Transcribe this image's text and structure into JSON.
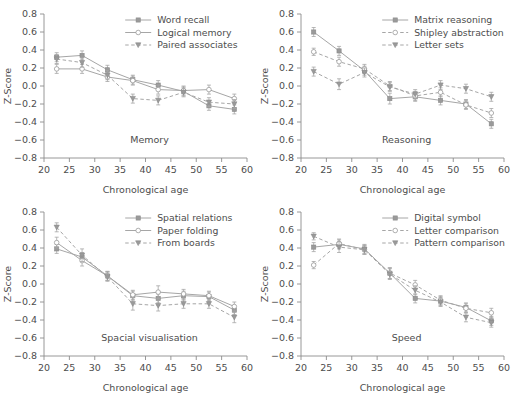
{
  "figure": {
    "x_axis_label": "Chronological age",
    "y_axis_label": "Z-Score",
    "x_ticks": [
      20,
      25,
      30,
      35,
      40,
      45,
      50,
      55,
      60
    ],
    "y_ticks": [
      -0.8,
      -0.6,
      -0.4,
      -0.2,
      0.0,
      0.2,
      0.4,
      0.6,
      0.8
    ],
    "xlim": [
      20,
      60
    ],
    "ylim": [
      -0.8,
      0.8
    ],
    "line_color": "#a6a6a6",
    "text_color": "#4d4d4d",
    "background": "#ffffff"
  },
  "chart_data": [
    {
      "type": "line",
      "title": "Memory",
      "panel_id": "memory",
      "xlabel": "Chronological age",
      "ylabel": "Z-Score",
      "xlim": [
        20,
        60
      ],
      "ylim": [
        -0.8,
        0.8
      ],
      "grid": false,
      "legend_position": "top-right",
      "x": [
        22.5,
        27.5,
        32.5,
        37.5,
        42.5,
        47.5,
        52.5,
        57.5
      ],
      "series": [
        {
          "name": "Word recall",
          "marker": "filled-square",
          "dash": "solid",
          "values": [
            0.32,
            0.34,
            0.18,
            0.07,
            0.01,
            -0.06,
            -0.22,
            -0.26
          ],
          "errors": [
            0.05,
            0.05,
            0.05,
            0.05,
            0.05,
            0.05,
            0.05,
            0.05
          ]
        },
        {
          "name": "Logical memory",
          "marker": "open-circle",
          "dash": "solid",
          "values": [
            0.19,
            0.19,
            0.1,
            0.06,
            -0.04,
            -0.05,
            -0.04,
            -0.14
          ],
          "errors": [
            0.05,
            0.05,
            0.05,
            0.05,
            0.05,
            0.05,
            0.05,
            0.05
          ]
        },
        {
          "name": "Paired associates",
          "marker": "filled-triangle",
          "dash": "dashed",
          "values": [
            0.3,
            0.26,
            0.12,
            -0.14,
            -0.16,
            -0.07,
            -0.18,
            -0.2
          ],
          "errors": [
            0.05,
            0.05,
            0.05,
            0.05,
            0.05,
            0.05,
            0.05,
            0.05
          ]
        }
      ]
    },
    {
      "type": "line",
      "title": "Reasoning",
      "panel_id": "reasoning",
      "xlabel": "Chronological age",
      "ylabel": "Z-Score",
      "xlim": [
        20,
        60
      ],
      "ylim": [
        -0.8,
        0.8
      ],
      "grid": false,
      "legend_position": "top-right",
      "x": [
        22.5,
        27.5,
        32.5,
        37.5,
        42.5,
        47.5,
        52.5,
        57.5
      ],
      "series": [
        {
          "name": "Matrix reasoning",
          "marker": "filled-square",
          "dash": "solid",
          "values": [
            0.6,
            0.39,
            0.17,
            -0.14,
            -0.12,
            -0.16,
            -0.2,
            -0.42
          ],
          "errors": [
            0.05,
            0.05,
            0.05,
            0.06,
            0.05,
            0.05,
            0.05,
            0.05
          ]
        },
        {
          "name": "Shipley abstraction",
          "marker": "open-circle",
          "dash": "dashed",
          "values": [
            0.38,
            0.27,
            0.19,
            0.0,
            -0.11,
            -0.07,
            -0.21,
            -0.3
          ],
          "errors": [
            0.04,
            0.05,
            0.05,
            0.05,
            0.05,
            0.05,
            0.05,
            0.05
          ]
        },
        {
          "name": "Letter sets",
          "marker": "filled-triangle",
          "dash": "dashed",
          "values": [
            0.16,
            0.02,
            0.15,
            -0.01,
            -0.09,
            0.01,
            -0.03,
            -0.12
          ],
          "errors": [
            0.05,
            0.06,
            0.05,
            0.05,
            0.05,
            0.05,
            0.05,
            0.05
          ]
        }
      ]
    },
    {
      "type": "line",
      "title": "Spacial visualisation",
      "panel_id": "spatial",
      "xlabel": "Chronological age",
      "ylabel": "Z-Score",
      "xlim": [
        20,
        60
      ],
      "ylim": [
        -0.8,
        0.8
      ],
      "grid": false,
      "legend_position": "top-right",
      "x": [
        22.5,
        27.5,
        32.5,
        37.5,
        42.5,
        47.5,
        52.5,
        57.5
      ],
      "series": [
        {
          "name": "Spatial relations",
          "marker": "filled-square",
          "dash": "solid",
          "values": [
            0.39,
            0.3,
            0.09,
            -0.13,
            -0.16,
            -0.13,
            -0.14,
            -0.29
          ],
          "errors": [
            0.05,
            0.05,
            0.05,
            0.05,
            0.05,
            0.05,
            0.05,
            0.05
          ]
        },
        {
          "name": "Paper folding",
          "marker": "open-circle",
          "dash": "solid",
          "values": [
            0.46,
            0.26,
            0.09,
            -0.12,
            -0.09,
            -0.11,
            -0.13,
            -0.25
          ],
          "errors": [
            0.06,
            0.06,
            0.05,
            0.05,
            0.07,
            0.05,
            0.05,
            0.05
          ]
        },
        {
          "name": "From boards",
          "marker": "filled-triangle",
          "dash": "dashed",
          "values": [
            0.63,
            0.32,
            0.08,
            -0.22,
            -0.24,
            -0.22,
            -0.22,
            -0.37
          ],
          "errors": [
            0.05,
            0.07,
            0.05,
            0.07,
            0.06,
            0.05,
            0.05,
            0.06
          ]
        }
      ]
    },
    {
      "type": "line",
      "title": "Speed",
      "panel_id": "speed",
      "xlabel": "Chronological age",
      "ylabel": "Z-Score",
      "xlim": [
        20,
        60
      ],
      "ylim": [
        -0.8,
        0.8
      ],
      "grid": false,
      "legend_position": "top-right",
      "x": [
        22.5,
        27.5,
        32.5,
        37.5,
        42.5,
        47.5,
        52.5,
        57.5
      ],
      "series": [
        {
          "name": "Digital symbol",
          "marker": "filled-square",
          "dash": "solid",
          "values": [
            0.41,
            0.44,
            0.39,
            0.12,
            -0.16,
            -0.19,
            -0.26,
            -0.41
          ],
          "errors": [
            0.05,
            0.05,
            0.05,
            0.06,
            0.05,
            0.05,
            0.05,
            0.05
          ]
        },
        {
          "name": "Letter comparison",
          "marker": "open-circle",
          "dash": "dashed",
          "values": [
            0.21,
            0.45,
            0.38,
            0.12,
            -0.01,
            -0.18,
            -0.27,
            -0.32
          ],
          "errors": [
            0.04,
            0.05,
            0.05,
            0.06,
            0.05,
            0.05,
            0.05,
            0.05
          ]
        },
        {
          "name": "Pattern comparison",
          "marker": "filled-triangle",
          "dash": "dashed",
          "values": [
            0.53,
            0.41,
            0.38,
            0.11,
            -0.07,
            -0.2,
            -0.37,
            -0.43
          ],
          "errors": [
            0.04,
            0.06,
            0.05,
            0.06,
            0.05,
            0.05,
            0.05,
            0.05
          ]
        }
      ]
    }
  ]
}
